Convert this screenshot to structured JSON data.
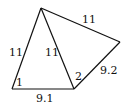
{
  "diagram": {
    "type": "geometry-figure",
    "stroke_color": "#111111",
    "background": "#ffffff",
    "vertices": {
      "top": [
        41,
        8
      ],
      "bottom_left": [
        12,
        89
      ],
      "bottom_mid": [
        74,
        89
      ],
      "right": [
        120,
        42
      ]
    },
    "edges": [
      {
        "id": "left",
        "from": "bottom_left",
        "to": "top",
        "label": "11"
      },
      {
        "id": "diagonal",
        "from": "bottom_mid",
        "to": "top",
        "label": "11"
      },
      {
        "id": "top_right",
        "from": "top",
        "to": "right",
        "label": "11"
      },
      {
        "id": "lower_right",
        "from": "bottom_mid",
        "to": "right",
        "label": "9.2"
      },
      {
        "id": "bottom",
        "from": "bottom_left",
        "to": "bottom_mid",
        "label": "9.1"
      }
    ],
    "angle_labels": [
      {
        "id": "angle1",
        "vertex": "bottom_left",
        "label": "1"
      },
      {
        "id": "angle2",
        "vertex": "bottom_mid",
        "label": "2"
      }
    ]
  }
}
